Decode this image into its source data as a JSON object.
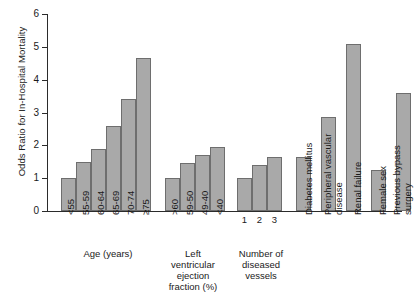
{
  "chart_data": {
    "type": "bar",
    "title": "",
    "xlabel": "",
    "ylabel": "Odds Ratio for In-Hospital Mortality",
    "ylim": [
      0,
      6
    ],
    "yticks": [
      0,
      1,
      2,
      3,
      4,
      5,
      6
    ],
    "grid": false,
    "legend": null,
    "bar_color": "#a9a9a9",
    "bar_edge_color": "#6e6e6e",
    "axis_color": "#2b2b2b",
    "categories": [
      "<55",
      "55-59",
      "60-64",
      "65-69",
      "70-74",
      "≥75",
      ">60",
      "59-50",
      "49-40",
      "<40",
      "1",
      "2",
      "3",
      "Diabetes mellitus",
      "Peripheral vascular disease",
      "Renal failure",
      "Female sex",
      "Previous bypass surgery"
    ],
    "values": [
      1.0,
      1.5,
      1.9,
      2.6,
      3.4,
      4.65,
      1.0,
      1.45,
      1.7,
      1.95,
      1.0,
      1.4,
      1.65,
      1.65,
      2.85,
      5.1,
      1.25,
      3.6
    ],
    "groups": [
      {
        "caption": "Age (years)",
        "caption_orientation": "horizontal",
        "tick_orientation": "vertical",
        "categories": [
          "<55",
          "55-59",
          "60-64",
          "65-69",
          "70-74",
          "≥75"
        ],
        "values": [
          1.0,
          1.5,
          1.9,
          2.6,
          3.4,
          4.65
        ]
      },
      {
        "caption": "Left ventricular ejection fraction (%)",
        "caption_orientation": "horizontal",
        "tick_orientation": "vertical",
        "categories": [
          ">60",
          "59-50",
          "49-40",
          "<40"
        ],
        "values": [
          1.0,
          1.45,
          1.7,
          1.95
        ]
      },
      {
        "caption": "Number of diseased vessels",
        "caption_orientation": "horizontal",
        "tick_orientation": "horizontal",
        "categories": [
          "1",
          "2",
          "3"
        ],
        "values": [
          1.0,
          1.4,
          1.65
        ]
      },
      {
        "caption": "",
        "caption_orientation": "vertical",
        "tick_orientation": "none",
        "categories": [
          "Diabetes mellitus",
          "Peripheral vascular disease",
          "Renal failure",
          "Female sex",
          "Previous bypass surgery"
        ],
        "values": [
          1.65,
          2.85,
          5.1,
          1.25,
          3.6
        ]
      }
    ]
  },
  "axis": {
    "y_label": "Odds Ratio for In-Hospital Mortality",
    "y_tick_0": "0",
    "y_tick_1": "1",
    "y_tick_2": "2",
    "y_tick_3": "3",
    "y_tick_4": "4",
    "y_tick_5": "5",
    "y_tick_6": "6"
  },
  "ticklabels": {
    "age_1": "<55",
    "age_2": "55-59",
    "age_3": "60-64",
    "age_4": "65-69",
    "age_5": "70-74",
    "age_6": "≥75",
    "lvef_1": ">60",
    "lvef_2": "59-50",
    "lvef_3": "49-40",
    "lvef_4": "<40",
    "ves_1": "1",
    "ves_2": "2",
    "ves_3": "3"
  },
  "captions": {
    "age": "Age (years)",
    "lvef_line1": "Left",
    "lvef_line2": "ventricular",
    "lvef_line3": "ejection",
    "lvef_line4": "fraction (%)",
    "vessels_line1": "Number of",
    "vessels_line2": "diseased",
    "vessels_line3": "vessels",
    "diabetes": "Diabetes mellitus",
    "pvd_line1": "Peripheral vascular",
    "pvd_line2": "disease",
    "renal": "Renal failure",
    "female": "Female sex",
    "bypass_line1": "Previous bypass",
    "bypass_line2": "surgery"
  }
}
